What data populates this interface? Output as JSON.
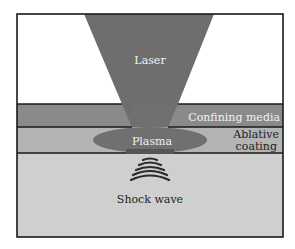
{
  "diagram": {
    "labels": {
      "laser": "Laser",
      "confining_media": "Confining media",
      "ablative_line1": "Ablative",
      "ablative_line2": "coating",
      "plasma": "Plasma",
      "shock_wave": "Shock wave"
    },
    "colors": {
      "background": "#ffffff",
      "frame": "#1a1a1a",
      "laser": "#6e6e6e",
      "confining_media": "#8a8a8a",
      "ablative_coating": "#b4b4b4",
      "substrate": "#cfcfcf",
      "plasma": "#707070",
      "shock_wave": "#2a2a2a",
      "light_text": "#f2f2f2",
      "dark_text": "#1e1e1e"
    }
  }
}
